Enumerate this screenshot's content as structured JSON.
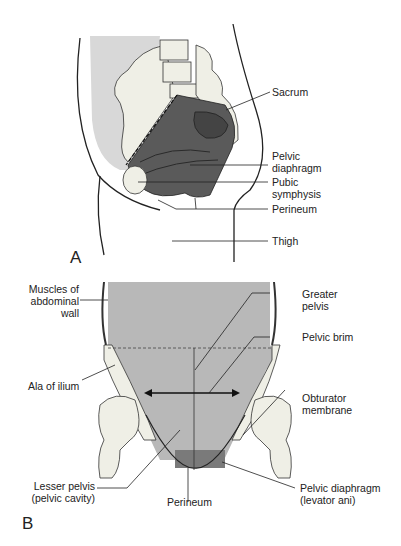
{
  "figure": {
    "panel_a": {
      "letter": "A",
      "labels": {
        "sacrum": "Sacrum",
        "pelvic_diaphragm_1": "Pelvic",
        "pelvic_diaphragm_2": "diaphragm",
        "pubic_symphysis_1": "Pubic",
        "pubic_symphysis_2": "symphysis",
        "perineum": "Perineum",
        "thigh": "Thigh"
      }
    },
    "panel_b": {
      "letter": "B",
      "labels": {
        "muscles_1": "Muscles of",
        "muscles_2": "abdominal",
        "muscles_3": "wall",
        "greater_pelvis_1": "Greater",
        "greater_pelvis_2": "pelvis",
        "pelvic_brim": "Pelvic brim",
        "ala_of_ilium": "Ala of ilium",
        "obturator_1": "Obturator",
        "obturator_2": "membrane",
        "lesser_pelvis_1": "Lesser pelvis",
        "lesser_pelvis_2": "(pelvic cavity)",
        "perineum": "Perineum",
        "pelvic_diaphragm_1": "Pelvic diaphragm",
        "pelvic_diaphragm_2": "(levator ani)"
      }
    },
    "colors": {
      "cavity_dark": "#5a5a5a",
      "region_light": "#d8d8d8",
      "region_mid": "#b8b8b8",
      "bone": "#efefe6",
      "line": "#333333"
    }
  }
}
